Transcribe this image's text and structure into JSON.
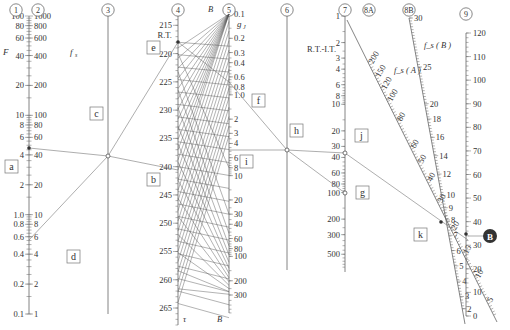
{
  "axes": [
    {
      "id": "1",
      "label": "1",
      "name": "F",
      "ticks": [
        "100",
        "80",
        "60",
        "40",
        "20",
        "10",
        "8",
        "6",
        "4",
        "2",
        "1.0",
        "0.8",
        "0.6",
        "0.4",
        "0.2",
        "0.1"
      ]
    },
    {
      "id": "2",
      "label": "2",
      "name": "f_s",
      "ticks": [
        "1000",
        "800",
        "600",
        "400",
        "200",
        "100",
        "80",
        "60",
        "40",
        "20",
        "10",
        "8",
        "6",
        "4",
        "2",
        "1"
      ]
    },
    {
      "id": "3",
      "label": "3",
      "name": "",
      "ticks": []
    },
    {
      "id": "4",
      "label": "4",
      "name": "R.T.",
      "ticks": [
        "215",
        "220",
        "225",
        "230",
        "235",
        "240",
        "245",
        "250",
        "255",
        "260",
        "265"
      ]
    },
    {
      "id": "5",
      "label": "5",
      "name": "g_J",
      "ticks": [
        "0.1",
        "0.2",
        "0.3",
        "0.4",
        "0.6",
        "0.8",
        "1.0",
        "2",
        "3",
        "4",
        "6",
        "8",
        "10",
        "20",
        "30",
        "40",
        "60",
        "80",
        "100",
        "200",
        "300"
      ]
    },
    {
      "id": "6",
      "label": "6",
      "name": "",
      "ticks": []
    },
    {
      "id": "7",
      "label": "7",
      "name": "R.T.-I.T.",
      "ticks": [
        "1",
        "2",
        "3",
        "4",
        "6",
        "8",
        "10",
        "20",
        "30",
        "40",
        "60",
        "80",
        "100",
        "200",
        "300",
        "500"
      ]
    },
    {
      "id": "8A",
      "label": "8A",
      "name": "f_s ( A )",
      "ticks": [
        "200",
        "150",
        "120",
        "100",
        "80",
        "60",
        "50",
        "40",
        "30",
        "20",
        "15",
        "10",
        "5"
      ]
    },
    {
      "id": "8B",
      "label": "8B",
      "name": "f_s ( B )",
      "ticks": [
        "30",
        "25",
        "20",
        "18",
        "16",
        "14",
        "12",
        "10",
        "9",
        "8",
        "7",
        "6",
        "5",
        "4",
        "3",
        "2"
      ]
    },
    {
      "id": "9",
      "label": "9",
      "name": "",
      "ticks": [
        "120",
        "110",
        "100",
        "90",
        "80",
        "70",
        "60",
        "50",
        "40",
        "30",
        "20",
        "10",
        "0"
      ]
    }
  ],
  "callouts": {
    "a": "a",
    "b": "b",
    "c": "c",
    "d": "d",
    "e": "e",
    "f": "f",
    "g": "g",
    "h": "h",
    "i": "i",
    "j": "j",
    "k": "k",
    "B": "B"
  },
  "fan_labels": {
    "top": "B",
    "bottom_left": "τ",
    "bottom_right": "B"
  },
  "colors": {
    "line": "#555555",
    "badge": "#333333",
    "background": "#ffffff"
  }
}
